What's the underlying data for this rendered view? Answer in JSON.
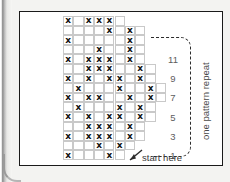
{
  "chart_data": {
    "type": "table",
    "symbol": "x",
    "symbol_meaning": "marked stitch",
    "rows_count": 12,
    "columns_count": 9,
    "row_labels": [
      "11",
      "9",
      "7",
      "5",
      "3",
      "1"
    ],
    "row_label_rows": [
      11,
      9,
      7,
      5,
      3,
      1
    ],
    "grid_rows_bottom_to_top": [
      {
        "row": 1,
        "filled_columns": [
          0,
          4
        ]
      },
      {
        "row": 2,
        "filled_columns": [
          3,
          5
        ]
      },
      {
        "row": 3,
        "filled_columns": [
          0,
          2,
          3,
          4,
          6
        ]
      },
      {
        "row": 4,
        "filled_columns": [
          2,
          3,
          4,
          6
        ]
      },
      {
        "row": 5,
        "filled_columns": [
          0,
          2,
          4,
          5,
          7
        ]
      },
      {
        "row": 6,
        "filled_columns": [
          1,
          5,
          7
        ]
      },
      {
        "row": 7,
        "filled_columns": [
          0,
          2,
          3,
          6,
          8
        ]
      },
      {
        "row": 8,
        "filled_columns": [
          1,
          5,
          8
        ]
      },
      {
        "row": 9,
        "filled_columns": [
          0,
          2,
          4,
          5,
          7
        ]
      },
      {
        "row": 10,
        "filled_columns": [
          2,
          3,
          4,
          7
        ]
      },
      {
        "row": 11,
        "filled_columns": [
          0,
          2,
          3,
          4,
          6
        ]
      },
      {
        "row": 12,
        "filled_columns": [
          3,
          6
        ]
      },
      {
        "row": 13,
        "filled_columns": [
          0,
          6
        ]
      },
      {
        "row": 14,
        "filled_columns": [
          4,
          6
        ]
      },
      {
        "row": 15,
        "filled_columns": [
          0,
          2,
          3,
          4
        ]
      }
    ],
    "xlabel": "",
    "ylabel": "",
    "grid": true,
    "legend": []
  },
  "annotations": {
    "repeat_label": "one pattern repeat",
    "start_label": "start here"
  }
}
